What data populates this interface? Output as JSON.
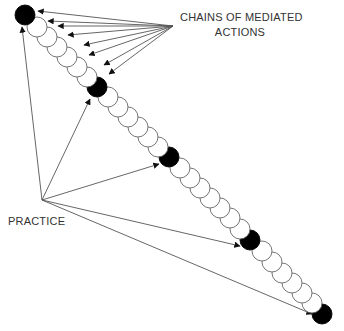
{
  "labels": {
    "chains_line1": "CHAINS OF MEDIATED",
    "chains_line2": "ACTIONS",
    "practice": "PRACTICE"
  },
  "colors": {
    "background": "#ffffff",
    "stroke": "#555555",
    "filled_node": "#000000",
    "empty_node": "#ffffff",
    "text": "#333333"
  },
  "chain": {
    "node_radius": 10,
    "nodes": [
      {
        "x": 25,
        "y": 15,
        "filled": true
      },
      {
        "x": 37,
        "y": 27,
        "filled": false
      },
      {
        "x": 47,
        "y": 37,
        "filled": false
      },
      {
        "x": 57,
        "y": 47,
        "filled": false
      },
      {
        "x": 67,
        "y": 57,
        "filled": false
      },
      {
        "x": 77,
        "y": 67,
        "filled": false
      },
      {
        "x": 87,
        "y": 77,
        "filled": false
      },
      {
        "x": 97,
        "y": 87,
        "filled": true
      },
      {
        "x": 108,
        "y": 97,
        "filled": false
      },
      {
        "x": 118,
        "y": 107,
        "filled": false
      },
      {
        "x": 128,
        "y": 117,
        "filled": false
      },
      {
        "x": 138,
        "y": 127,
        "filled": false
      },
      {
        "x": 148,
        "y": 137,
        "filled": false
      },
      {
        "x": 158,
        "y": 147,
        "filled": false
      },
      {
        "x": 169,
        "y": 157,
        "filled": true
      },
      {
        "x": 180,
        "y": 168,
        "filled": false
      },
      {
        "x": 190,
        "y": 178,
        "filled": false
      },
      {
        "x": 200,
        "y": 188,
        "filled": false
      },
      {
        "x": 210,
        "y": 198,
        "filled": false
      },
      {
        "x": 220,
        "y": 208,
        "filled": false
      },
      {
        "x": 230,
        "y": 218,
        "filled": false
      },
      {
        "x": 240,
        "y": 229,
        "filled": false
      },
      {
        "x": 250,
        "y": 240,
        "filled": true
      },
      {
        "x": 262,
        "y": 251,
        "filled": false
      },
      {
        "x": 272,
        "y": 262,
        "filled": false
      },
      {
        "x": 282,
        "y": 273,
        "filled": false
      },
      {
        "x": 292,
        "y": 283,
        "filled": false
      },
      {
        "x": 302,
        "y": 293,
        "filled": false
      },
      {
        "x": 312,
        "y": 303,
        "filled": false
      },
      {
        "x": 322,
        "y": 314,
        "filled": true
      }
    ]
  },
  "arrows": {
    "chains_origin": {
      "x": 173,
      "y": 26
    },
    "chains_targets": [
      {
        "x": 38,
        "y": 11
      },
      {
        "x": 48,
        "y": 21
      },
      {
        "x": 58,
        "y": 26
      },
      {
        "x": 68,
        "y": 35
      },
      {
        "x": 84,
        "y": 45
      },
      {
        "x": 89,
        "y": 55
      },
      {
        "x": 104,
        "y": 65
      },
      {
        "x": 109,
        "y": 74
      }
    ],
    "practice_origin": {
      "x": 42,
      "y": 200
    },
    "practice_targets": [
      {
        "x": 22,
        "y": 27
      },
      {
        "x": 90,
        "y": 99
      },
      {
        "x": 159,
        "y": 164
      },
      {
        "x": 240,
        "y": 246
      },
      {
        "x": 312,
        "y": 314
      }
    ]
  }
}
